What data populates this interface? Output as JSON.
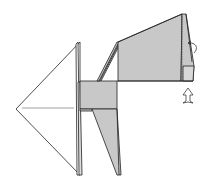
{
  "diagram": {
    "type": "origami-instruction-step",
    "colors": {
      "background": "#ffffff",
      "paper_front": "#ffffff",
      "paper_back": "#c8c8c8",
      "line": "#222222"
    },
    "symbols": [
      {
        "name": "push-in-arrow",
        "direction": "up",
        "position": "below head"
      },
      {
        "name": "fold-behind-arrow",
        "position": "head tip"
      },
      {
        "name": "mountain-fold-line",
        "position": "head"
      }
    ]
  }
}
